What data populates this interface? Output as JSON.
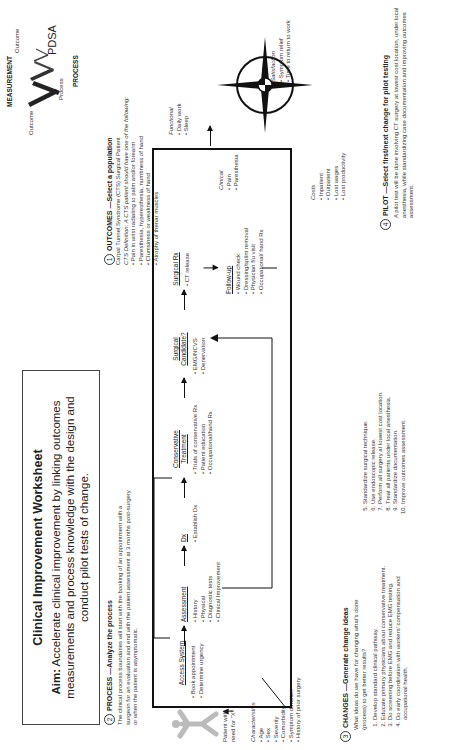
{
  "header": {
    "title": "Clinical Improvement Worksheet",
    "aim_label": "Aim:",
    "aim_text": "Accelerate clinical improvement by linking outcomes measurements and process knowledge with the design and conduct pilot tests of change."
  },
  "measurement_diagram": {
    "label_top": "MEASUREMENT",
    "label_bottom": "PROCESS",
    "outcome_left": "Outcome",
    "process_label": "Process",
    "outcome_right": "Outcome",
    "pdsa": "PDSA"
  },
  "sections": {
    "process": {
      "number": "2",
      "heading": "PROCESS —Analyze the process",
      "text": "The clinical process boundaries will start with the booking of an appointment with a surgeon for an evaluation and end with the patient assessment at 3 months post-surgery or when the patient is asymptomatic."
    },
    "outcomes": {
      "number": "1",
      "heading": "OUTCOMES —Select a population",
      "line1": "Carpal Tunnel Syndrome (CTS) Surgical Patient",
      "line2": "CTS Definition: A CTS patient should have one of the following:",
      "bullets": [
        "Pain in wrist radiating to palm and/or forearm",
        "Paresthesia, hyperesthesia, numbness of hand",
        "Clumsiness or weakness of hand",
        "Atrophy of thenar muscles"
      ]
    },
    "changes": {
      "number": "3",
      "heading": "CHANGES —Generate change ideas",
      "question": "What ideas do we have for changing what's done (process) to get better results?",
      "items_left": [
        "Develop standard clinical pathway.",
        "Educate primary physicians about conservative treatment.",
        "Do screening before EMG and reduce EMG testing.",
        "Do early coordination with workers' compensation and occupational health."
      ],
      "items_right": [
        "Standardize surgical technique.",
        "Use endoscopic release.",
        "Perform all surgery at lowest cost location.",
        "Treat all patients under local anesthesia.",
        "Standardize documentation.",
        "Improve outcomes assessment."
      ]
    },
    "pilot": {
      "number": "4",
      "heading": "PILOT —Select first/next change for pilot testing",
      "text": "A pilot test will be done involving CT surgery at lowest cost location, under local anesthesia, while standardizing case documentation and improving outcomes assessment."
    }
  },
  "process_flow": {
    "patient_label": "Patient with need for \"X\"",
    "characteristics_label": "Characteristics",
    "characteristics": [
      "Age",
      "Sex",
      "Severity",
      "Comorbidity",
      "Symptom duration",
      "History of prior surgery"
    ],
    "steps": [
      {
        "title": "Access System",
        "items": [
          "Book appointment",
          "Determine urgency"
        ]
      },
      {
        "title": "Assessment",
        "items": [
          "History",
          "Physical",
          "Diagnostic tests",
          "Clinical Improvement"
        ]
      },
      {
        "title": "Dx",
        "items": [
          "Establish Dx"
        ]
      },
      {
        "title": "Conservative Treatment",
        "items": [
          "Trials of conservative Rx",
          "Patient education",
          "Occupational/hand Rx"
        ]
      },
      {
        "title": "Surgical Candidate?",
        "items": [
          "EMG/NCVS",
          "Denervation"
        ]
      },
      {
        "title": "Surgical Rx",
        "items": [
          "CT release"
        ]
      },
      {
        "title": "Follow-up",
        "items": [
          "Wound check",
          "Dressing/splint removal",
          "Physician f/u visit",
          "Occupational/ hand Rx"
        ]
      }
    ]
  },
  "compass": {
    "functional": {
      "label": "Functional",
      "items": [
        "Daily work",
        "Sleep"
      ]
    },
    "satisfaction": {
      "label": "Satisfaction",
      "items": [
        "Symptom relief",
        "Time to return to work"
      ]
    },
    "clinical": {
      "label": "Clinical",
      "items": [
        "Pain",
        "Paresthesia"
      ]
    },
    "costs": {
      "label": "Costs",
      "items": [
        "Inpatient",
        "Outpatient",
        "Lost wages",
        "Lost productivity"
      ]
    }
  }
}
